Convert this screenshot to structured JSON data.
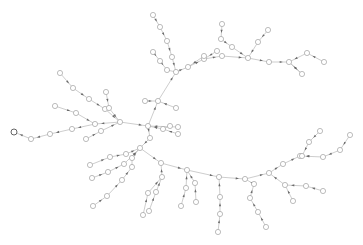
{
  "diagram": {
    "type": "tree-graph",
    "colors": {
      "background": "#ffffff",
      "edge": "#b8b8b8",
      "node_stroke": "#a0a0a0",
      "root_stroke": "#555555",
      "arrow": "#6a6a6a"
    },
    "node_radius": 2.6,
    "root": "n0",
    "nodes": [
      {
        "id": "n0",
        "x": 14,
        "y": 132,
        "root": true
      },
      {
        "id": "n1",
        "x": 31,
        "y": 139
      },
      {
        "id": "n2",
        "x": 50,
        "y": 134
      },
      {
        "id": "n3",
        "x": 72,
        "y": 129
      },
      {
        "id": "n4",
        "x": 95,
        "y": 124
      },
      {
        "id": "n5",
        "x": 55,
        "y": 106
      },
      {
        "id": "n6",
        "x": 76,
        "y": 113
      },
      {
        "id": "n7",
        "x": 86,
        "y": 139
      },
      {
        "id": "n8",
        "x": 101,
        "y": 131
      },
      {
        "id": "n9",
        "x": 120,
        "y": 122
      },
      {
        "id": "n10",
        "x": 60,
        "y": 73
      },
      {
        "id": "n11",
        "x": 73,
        "y": 88
      },
      {
        "id": "n12",
        "x": 89,
        "y": 99
      },
      {
        "id": "n13",
        "x": 105,
        "y": 109
      },
      {
        "id": "n14",
        "x": 106,
        "y": 92
      },
      {
        "id": "n15",
        "x": 109,
        "y": 108
      },
      {
        "id": "n16",
        "x": 148,
        "y": 126
      },
      {
        "id": "n17",
        "x": 158,
        "y": 101
      },
      {
        "id": "n18",
        "x": 145,
        "y": 101
      },
      {
        "id": "n19",
        "x": 176,
        "y": 108
      },
      {
        "id": "n20",
        "x": 170,
        "y": 126
      },
      {
        "id": "n21",
        "x": 178,
        "y": 127
      },
      {
        "id": "n22",
        "x": 178,
        "y": 134
      },
      {
        "id": "n23",
        "x": 163,
        "y": 129
      },
      {
        "id": "n24",
        "x": 153,
        "y": 15
      },
      {
        "id": "n25",
        "x": 160,
        "y": 27
      },
      {
        "id": "n26",
        "x": 167,
        "y": 41
      },
      {
        "id": "n27",
        "x": 172,
        "y": 57
      },
      {
        "id": "n28",
        "x": 176,
        "y": 72
      },
      {
        "id": "n29",
        "x": 153,
        "y": 52
      },
      {
        "id": "n30",
        "x": 160,
        "y": 61
      },
      {
        "id": "n31",
        "x": 167,
        "y": 70
      },
      {
        "id": "n32",
        "x": 188,
        "y": 67
      },
      {
        "id": "n33",
        "x": 204,
        "y": 59
      },
      {
        "id": "n34",
        "x": 217,
        "y": 51
      },
      {
        "id": "n35",
        "x": 204,
        "y": 56
      },
      {
        "id": "n36",
        "x": 222,
        "y": 56
      },
      {
        "id": "n37",
        "x": 222,
        "y": 24
      },
      {
        "id": "n38",
        "x": 221,
        "y": 39
      },
      {
        "id": "n39",
        "x": 232,
        "y": 47
      },
      {
        "id": "n40",
        "x": 248,
        "y": 58
      },
      {
        "id": "n41",
        "x": 258,
        "y": 42
      },
      {
        "id": "n42",
        "x": 268,
        "y": 30
      },
      {
        "id": "n43",
        "x": 269,
        "y": 62
      },
      {
        "id": "n44",
        "x": 289,
        "y": 62
      },
      {
        "id": "n45",
        "x": 307,
        "y": 53
      },
      {
        "id": "n46",
        "x": 324,
        "y": 62
      },
      {
        "id": "n47",
        "x": 302,
        "y": 74
      },
      {
        "id": "n48",
        "x": 140,
        "y": 148
      },
      {
        "id": "n49",
        "x": 126,
        "y": 154
      },
      {
        "id": "n50",
        "x": 110,
        "y": 157
      },
      {
        "id": "n51",
        "x": 90,
        "y": 165
      },
      {
        "id": "n52",
        "x": 124,
        "y": 164
      },
      {
        "id": "n53",
        "x": 108,
        "y": 172
      },
      {
        "id": "n54",
        "x": 92,
        "y": 178
      },
      {
        "id": "n55",
        "x": 132,
        "y": 167
      },
      {
        "id": "n56",
        "x": 122,
        "y": 180
      },
      {
        "id": "n57",
        "x": 107,
        "y": 196
      },
      {
        "id": "n58",
        "x": 93,
        "y": 206
      },
      {
        "id": "n59",
        "x": 132,
        "y": 158
      },
      {
        "id": "n60",
        "x": 161,
        "y": 163
      },
      {
        "id": "n61",
        "x": 162,
        "y": 177
      },
      {
        "id": "n62",
        "x": 156,
        "y": 192
      },
      {
        "id": "n63",
        "x": 149,
        "y": 211
      },
      {
        "id": "n64",
        "x": 148,
        "y": 193
      },
      {
        "id": "n65",
        "x": 143,
        "y": 215
      },
      {
        "id": "n66",
        "x": 187,
        "y": 170
      },
      {
        "id": "n67",
        "x": 186,
        "y": 188
      },
      {
        "id": "n68",
        "x": 181,
        "y": 206
      },
      {
        "id": "n69",
        "x": 195,
        "y": 183
      },
      {
        "id": "n70",
        "x": 196,
        "y": 202
      },
      {
        "id": "n71",
        "x": 219,
        "y": 177
      },
      {
        "id": "n72",
        "x": 220,
        "y": 197
      },
      {
        "id": "n73",
        "x": 220,
        "y": 214
      },
      {
        "id": "n74",
        "x": 218,
        "y": 232
      },
      {
        "id": "n75",
        "x": 245,
        "y": 179
      },
      {
        "id": "n76",
        "x": 254,
        "y": 184
      },
      {
        "id": "n77",
        "x": 250,
        "y": 198
      },
      {
        "id": "n78",
        "x": 258,
        "y": 212
      },
      {
        "id": "n79",
        "x": 266,
        "y": 227
      },
      {
        "id": "n80",
        "x": 269,
        "y": 173
      },
      {
        "id": "n81",
        "x": 285,
        "y": 185
      },
      {
        "id": "n82",
        "x": 293,
        "y": 201
      },
      {
        "id": "n83",
        "x": 306,
        "y": 186
      },
      {
        "id": "n84",
        "x": 323,
        "y": 191
      },
      {
        "id": "n85",
        "x": 283,
        "y": 164
      },
      {
        "id": "n86",
        "x": 300,
        "y": 156
      },
      {
        "id": "n87",
        "x": 302,
        "y": 156
      },
      {
        "id": "n88",
        "x": 309,
        "y": 142
      },
      {
        "id": "n89",
        "x": 320,
        "y": 131
      },
      {
        "id": "n90",
        "x": 323,
        "y": 157
      },
      {
        "id": "n91",
        "x": 340,
        "y": 150
      },
      {
        "id": "n92",
        "x": 350,
        "y": 135
      },
      {
        "id": "n93",
        "x": 150,
        "y": 138
      }
    ],
    "edges": [
      [
        "n1",
        "n0"
      ],
      [
        "n2",
        "n1"
      ],
      [
        "n3",
        "n2"
      ],
      [
        "n4",
        "n3"
      ],
      [
        "n9",
        "n4"
      ],
      [
        "n5",
        "n6"
      ],
      [
        "n6",
        "n4"
      ],
      [
        "n7",
        "n8"
      ],
      [
        "n8",
        "n9"
      ],
      [
        "n10",
        "n11"
      ],
      [
        "n11",
        "n12"
      ],
      [
        "n12",
        "n13"
      ],
      [
        "n13",
        "n9"
      ],
      [
        "n14",
        "n15"
      ],
      [
        "n15",
        "n9"
      ],
      [
        "n9",
        "n16"
      ],
      [
        "n16",
        "n17"
      ],
      [
        "n17",
        "n28"
      ],
      [
        "n18",
        "n17"
      ],
      [
        "n19",
        "n17"
      ],
      [
        "n20",
        "n23"
      ],
      [
        "n21",
        "n16"
      ],
      [
        "n22",
        "n23"
      ],
      [
        "n23",
        "n16"
      ],
      [
        "n24",
        "n25"
      ],
      [
        "n25",
        "n26"
      ],
      [
        "n26",
        "n27"
      ],
      [
        "n27",
        "n28"
      ],
      [
        "n29",
        "n30"
      ],
      [
        "n30",
        "n31"
      ],
      [
        "n31",
        "n28"
      ],
      [
        "n28",
        "n32"
      ],
      [
        "n32",
        "n33"
      ],
      [
        "n33",
        "n36"
      ],
      [
        "n35",
        "n32"
      ],
      [
        "n34",
        "n33"
      ],
      [
        "n37",
        "n38"
      ],
      [
        "n38",
        "n39"
      ],
      [
        "n39",
        "n40"
      ],
      [
        "n36",
        "n40"
      ],
      [
        "n40",
        "n43"
      ],
      [
        "n42",
        "n41"
      ],
      [
        "n41",
        "n40"
      ],
      [
        "n43",
        "n44"
      ],
      [
        "n44",
        "n47"
      ],
      [
        "n45",
        "n44"
      ],
      [
        "n46",
        "n45"
      ],
      [
        "n47",
        "n44"
      ],
      [
        "n16",
        "n93"
      ],
      [
        "n93",
        "n48"
      ],
      [
        "n48",
        "n60"
      ],
      [
        "n49",
        "n48"
      ],
      [
        "n50",
        "n49"
      ],
      [
        "n51",
        "n50"
      ],
      [
        "n52",
        "n48"
      ],
      [
        "n53",
        "n52"
      ],
      [
        "n54",
        "n53"
      ],
      [
        "n59",
        "n48"
      ],
      [
        "n55",
        "n59"
      ],
      [
        "n56",
        "n55"
      ],
      [
        "n57",
        "n56"
      ],
      [
        "n58",
        "n57"
      ],
      [
        "n60",
        "n66"
      ],
      [
        "n61",
        "n60"
      ],
      [
        "n62",
        "n61"
      ],
      [
        "n63",
        "n62"
      ],
      [
        "n64",
        "n61"
      ],
      [
        "n65",
        "n64"
      ],
      [
        "n66",
        "n71"
      ],
      [
        "n67",
        "n66"
      ],
      [
        "n68",
        "n67"
      ],
      [
        "n69",
        "n66"
      ],
      [
        "n70",
        "n69"
      ],
      [
        "n71",
        "n75"
      ],
      [
        "n72",
        "n71"
      ],
      [
        "n73",
        "n72"
      ],
      [
        "n74",
        "n73"
      ],
      [
        "n75",
        "n80"
      ],
      [
        "n76",
        "n75"
      ],
      [
        "n77",
        "n76"
      ],
      [
        "n78",
        "n77"
      ],
      [
        "n79",
        "n78"
      ],
      [
        "n80",
        "n85"
      ],
      [
        "n81",
        "n80"
      ],
      [
        "n82",
        "n81"
      ],
      [
        "n83",
        "n81"
      ],
      [
        "n84",
        "n83"
      ],
      [
        "n85",
        "n86"
      ],
      [
        "n87",
        "n86"
      ],
      [
        "n88",
        "n87"
      ],
      [
        "n89",
        "n88"
      ],
      [
        "n90",
        "n86"
      ],
      [
        "n91",
        "n90"
      ],
      [
        "n92",
        "n91"
      ]
    ]
  }
}
